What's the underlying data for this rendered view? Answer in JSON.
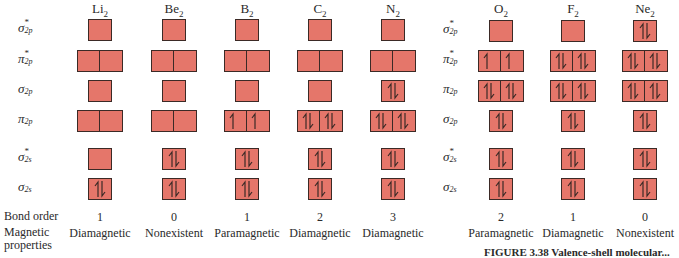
{
  "figure": {
    "colors": {
      "box_fill": "#e5766a",
      "box_border": "#3b2a26",
      "text": "#2a2a2a"
    },
    "orbital_labels": [
      {
        "key": "sigma_star_2p",
        "symbol": "σ",
        "star": "*",
        "sub": "2p"
      },
      {
        "key": "pi_star_2p",
        "symbol": "π",
        "star": "*",
        "sub": "2p"
      },
      {
        "key": "sigma_2p",
        "symbol": "σ",
        "star": "",
        "sub": "2p"
      },
      {
        "key": "pi_2p",
        "symbol": "π",
        "star": "",
        "sub": "2p"
      },
      {
        "key": "sigma_star_2s",
        "symbol": "σ",
        "star": "*",
        "sub": "2s"
      },
      {
        "key": "sigma_2s",
        "symbol": "σ",
        "star": "",
        "sub": "2s"
      }
    ],
    "row_labels": {
      "bond_order": "Bond order",
      "magnetic_line1": "Magnetic",
      "magnetic_line2": "properties"
    },
    "molecules_group1": [
      {
        "name": "Li",
        "sub": "2",
        "bond_order": "1",
        "magnetic": "Diamagnetic",
        "orbitals": {
          "sigma_star_2p": [
            ""
          ],
          "pi_star_2p": [
            "",
            ""
          ],
          "sigma_2p": [
            ""
          ],
          "pi_2p": [
            "",
            ""
          ],
          "sigma_star_2s": [
            ""
          ],
          "sigma_2s": [
            "ud"
          ]
        }
      },
      {
        "name": "Be",
        "sub": "2",
        "bond_order": "0",
        "magnetic": "Nonexistent",
        "orbitals": {
          "sigma_star_2p": [
            ""
          ],
          "pi_star_2p": [
            "",
            ""
          ],
          "sigma_2p": [
            ""
          ],
          "pi_2p": [
            "",
            ""
          ],
          "sigma_star_2s": [
            "ud"
          ],
          "sigma_2s": [
            "ud"
          ]
        }
      },
      {
        "name": "B",
        "sub": "2",
        "bond_order": "1",
        "magnetic": "Paramagnetic",
        "orbitals": {
          "sigma_star_2p": [
            ""
          ],
          "pi_star_2p": [
            "",
            ""
          ],
          "sigma_2p": [
            ""
          ],
          "pi_2p": [
            "u",
            "u"
          ],
          "sigma_star_2s": [
            "ud"
          ],
          "sigma_2s": [
            "ud"
          ]
        }
      },
      {
        "name": "C",
        "sub": "2",
        "bond_order": "2",
        "magnetic": "Diamagnetic",
        "orbitals": {
          "sigma_star_2p": [
            ""
          ],
          "pi_star_2p": [
            "",
            ""
          ],
          "sigma_2p": [
            ""
          ],
          "pi_2p": [
            "ud",
            "ud"
          ],
          "sigma_star_2s": [
            "ud"
          ],
          "sigma_2s": [
            "ud"
          ]
        }
      },
      {
        "name": "N",
        "sub": "2",
        "bond_order": "3",
        "magnetic": "Diamagnetic",
        "orbitals": {
          "sigma_star_2p": [
            ""
          ],
          "pi_star_2p": [
            "",
            ""
          ],
          "sigma_2p": [
            "ud"
          ],
          "pi_2p": [
            "ud",
            "ud"
          ],
          "sigma_star_2s": [
            "ud"
          ],
          "sigma_2s": [
            "ud"
          ]
        }
      }
    ],
    "molecules_group2": [
      {
        "name": "O",
        "sub": "2",
        "bond_order": "2",
        "magnetic": "Paramagnetic",
        "orbitals": {
          "sigma_star_2p": [
            ""
          ],
          "pi_star_2p": [
            "u",
            "u"
          ],
          "pi_2p": [
            "ud",
            "ud"
          ],
          "sigma_2p": [
            "ud"
          ],
          "sigma_star_2s": [
            "ud"
          ],
          "sigma_2s": [
            "ud"
          ]
        }
      },
      {
        "name": "F",
        "sub": "2",
        "bond_order": "1",
        "magnetic": "Diamagnetic",
        "orbitals": {
          "sigma_star_2p": [
            ""
          ],
          "pi_star_2p": [
            "ud",
            "ud"
          ],
          "pi_2p": [
            "ud",
            "ud"
          ],
          "sigma_2p": [
            "ud"
          ],
          "sigma_star_2s": [
            "ud"
          ],
          "sigma_2s": [
            "ud"
          ]
        }
      },
      {
        "name": "Ne",
        "sub": "2",
        "bond_order": "0",
        "magnetic": "Nonexistent",
        "orbitals": {
          "sigma_star_2p": [
            "ud"
          ],
          "pi_star_2p": [
            "ud",
            "ud"
          ],
          "pi_2p": [
            "ud",
            "ud"
          ],
          "sigma_2p": [
            "ud"
          ],
          "sigma_star_2s": [
            "ud"
          ],
          "sigma_2s": [
            "ud"
          ]
        }
      }
    ],
    "caption": "FIGURE 3.38  Valence-shell molecular..."
  }
}
